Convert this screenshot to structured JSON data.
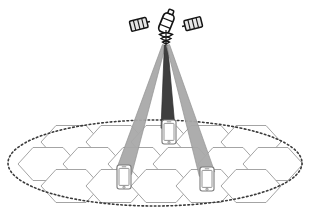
{
  "figure": {
    "background_color": "#ffffff",
    "width": 326,
    "height": 217
  },
  "satellite": {
    "label": "satellite",
    "body_color": "#ffffff",
    "outline_color": "#1a1a1a",
    "panel_color": "#e8e8e8",
    "panel_outline": "#1a1a1a",
    "position": {
      "x": 166,
      "y": 22
    },
    "solar_panels": [
      {
        "name": "left-solar-panel",
        "side": "left"
      },
      {
        "name": "right-solar-panel",
        "side": "right"
      }
    ],
    "antenna": {
      "name": "satellite-antenna",
      "position": {
        "x": 166,
        "y": 42
      }
    }
  },
  "beams": [
    {
      "id": "beam-left",
      "label": "left spot beam",
      "color": "#a9a9a9",
      "outline": "#8c8c8c",
      "opacity": 0.95,
      "apex": {
        "x": 164,
        "y": 45
      },
      "foot": {
        "x": 124,
        "y": 172
      },
      "target_terminal": "terminal-left"
    },
    {
      "id": "beam-center",
      "label": "center spot beam",
      "color": "#3f3f3f",
      "outline": "#2b2b2b",
      "opacity": 1.0,
      "apex": {
        "x": 166,
        "y": 45
      },
      "foot": {
        "x": 168,
        "y": 128
      },
      "target_terminal": "terminal-center"
    },
    {
      "id": "beam-right",
      "label": "right spot beam",
      "color": "#a9a9a9",
      "outline": "#8c8c8c",
      "opacity": 0.95,
      "apex": {
        "x": 168,
        "y": 45
      },
      "foot": {
        "x": 207,
        "y": 174
      },
      "target_terminal": "terminal-right"
    }
  ],
  "coverage_area": {
    "label": "total coverage footprint",
    "shape": "ellipse",
    "style": "dotted",
    "stroke_color": "#3a3a3a",
    "fill": "none",
    "center": {
      "x": 155,
      "y": 163
    },
    "radius_x": 147,
    "radius_y": 43
  },
  "cell_grid": {
    "label": "hexagonal cell grid",
    "stroke_color": "#9a9a9a",
    "fill": "#ffffff",
    "orientation": "pointy-left-right",
    "hex_radius": 30,
    "hex_height": 33,
    "rows": [
      {
        "row": 0,
        "y": 142,
        "x_start": 71,
        "count": 5,
        "x_step": 45
      },
      {
        "row": 1,
        "y": 164,
        "x_start": 48,
        "count": 6,
        "x_step": 45
      },
      {
        "row": 2,
        "y": 186,
        "x_start": 71,
        "count": 5,
        "x_step": 45
      }
    ]
  },
  "terminals": [
    {
      "id": "terminal-center",
      "label": "user terminal (center cell)",
      "icon": "smartphone-icon",
      "x": 162,
      "y": 120,
      "width": 14,
      "height": 24,
      "body_color": "#ffffff",
      "outline_color": "#7a7a7a",
      "screen_color": "#ffffff"
    },
    {
      "id": "terminal-left",
      "label": "user terminal (left cell)",
      "icon": "smartphone-icon",
      "x": 117,
      "y": 165,
      "width": 14,
      "height": 24,
      "body_color": "#ffffff",
      "outline_color": "#7a7a7a",
      "screen_color": "#ffffff"
    },
    {
      "id": "terminal-right",
      "label": "user terminal (right cell)",
      "icon": "smartphone-icon",
      "x": 200,
      "y": 167,
      "width": 14,
      "height": 24,
      "body_color": "#ffffff",
      "outline_color": "#7a7a7a",
      "screen_color": "#ffffff"
    }
  ],
  "colors": {
    "beam_light": "#a9a9a9",
    "beam_dark": "#3f3f3f",
    "hex_stroke": "#9a9a9a",
    "ellipse_stroke": "#3a3a3a",
    "satellite_outline": "#1a1a1a",
    "terminal_outline": "#7a7a7a",
    "background": "#ffffff"
  }
}
